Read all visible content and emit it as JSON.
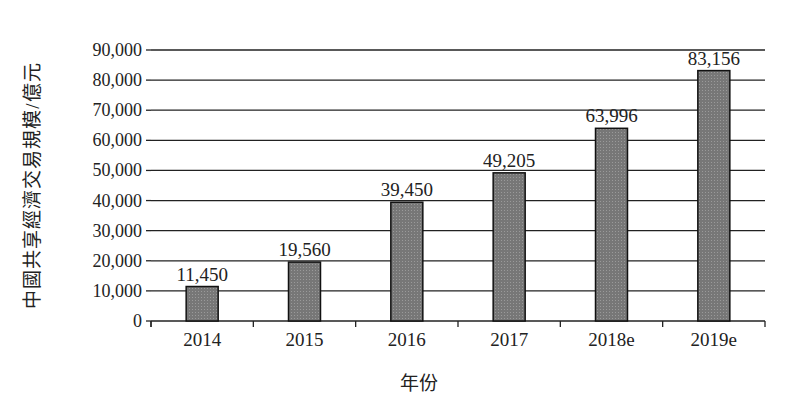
{
  "chart_data": {
    "type": "bar",
    "title": "",
    "xlabel": "年份",
    "ylabel": "中國共享經濟交易規模/億元",
    "categories": [
      "2014",
      "2015",
      "2016",
      "2017",
      "2018e",
      "2019e"
    ],
    "values": [
      11450,
      19560,
      39450,
      49205,
      63996,
      83156
    ],
    "value_labels": [
      "11,450",
      "19,560",
      "39,450",
      "49,205",
      "63,996",
      "83,156"
    ],
    "ylim": [
      0,
      90000
    ],
    "yticks": [
      0,
      10000,
      20000,
      30000,
      40000,
      50000,
      60000,
      70000,
      80000,
      90000
    ],
    "ytick_labels": [
      "0",
      "10,000",
      "20,000",
      "30,000",
      "40,000",
      "50,000",
      "60,000",
      "70,000",
      "80,000",
      "90,000"
    ],
    "grid": true,
    "legend": null,
    "bar_color": "#777777"
  }
}
